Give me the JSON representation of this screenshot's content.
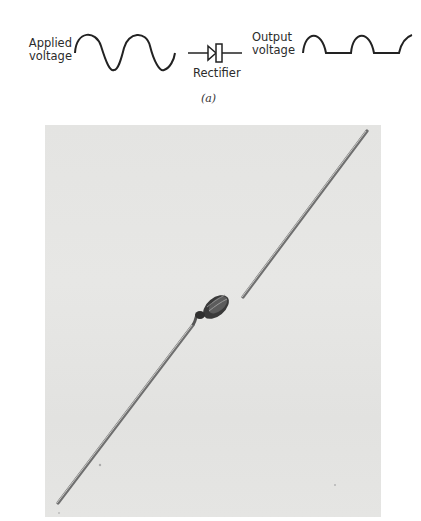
{
  "diagram": {
    "part_label": "(a)",
    "input": {
      "label_line1": "Applied",
      "label_line2": "voltage",
      "waveform": "full-sine"
    },
    "component": {
      "label": "Rectifier",
      "symbol": "diode-icon"
    },
    "output": {
      "label_line1": "Output",
      "label_line2": "voltage",
      "waveform": "half-wave-rectified"
    }
  },
  "photo": {
    "subject": "diode-with-axial-leads",
    "background": "#e5e5e3"
  }
}
